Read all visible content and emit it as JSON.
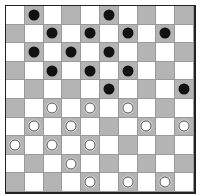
{
  "game": "draughts",
  "board": {
    "size": 10,
    "colors": {
      "light": "#ffffff",
      "dark": "#b4b4b4",
      "border": "#222222"
    },
    "dark_square_rule": "(row+col) odd"
  },
  "pieces": [
    {
      "row": 0,
      "col": 1,
      "color": "black"
    },
    {
      "row": 0,
      "col": 5,
      "color": "black"
    },
    {
      "row": 1,
      "col": 2,
      "color": "black"
    },
    {
      "row": 1,
      "col": 4,
      "color": "black"
    },
    {
      "row": 1,
      "col": 6,
      "color": "black"
    },
    {
      "row": 1,
      "col": 8,
      "color": "black"
    },
    {
      "row": 2,
      "col": 1,
      "color": "black"
    },
    {
      "row": 2,
      "col": 3,
      "color": "black"
    },
    {
      "row": 2,
      "col": 5,
      "color": "black"
    },
    {
      "row": 3,
      "col": 2,
      "color": "black"
    },
    {
      "row": 3,
      "col": 4,
      "color": "black"
    },
    {
      "row": 3,
      "col": 6,
      "color": "black"
    },
    {
      "row": 4,
      "col": 5,
      "color": "black"
    },
    {
      "row": 4,
      "col": 9,
      "color": "black"
    },
    {
      "row": 5,
      "col": 2,
      "color": "white"
    },
    {
      "row": 5,
      "col": 4,
      "color": "white"
    },
    {
      "row": 5,
      "col": 6,
      "color": "white"
    },
    {
      "row": 6,
      "col": 1,
      "color": "white"
    },
    {
      "row": 6,
      "col": 3,
      "color": "white"
    },
    {
      "row": 6,
      "col": 7,
      "color": "white"
    },
    {
      "row": 6,
      "col": 9,
      "color": "white"
    },
    {
      "row": 7,
      "col": 0,
      "color": "white"
    },
    {
      "row": 7,
      "col": 2,
      "color": "white"
    },
    {
      "row": 7,
      "col": 4,
      "color": "white"
    },
    {
      "row": 8,
      "col": 3,
      "color": "white"
    },
    {
      "row": 9,
      "col": 4,
      "color": "white"
    },
    {
      "row": 9,
      "col": 6,
      "color": "white"
    },
    {
      "row": 9,
      "col": 8,
      "color": "white"
    }
  ]
}
